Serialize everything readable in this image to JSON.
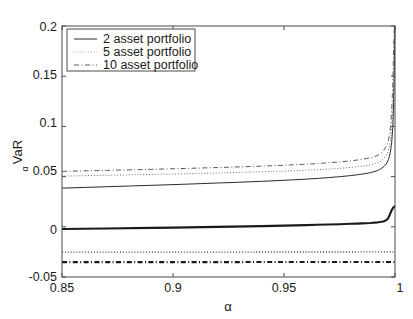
{
  "chart_data": {
    "type": "line",
    "title": "",
    "xlabel": "α",
    "ylabel": "VaR",
    "ylabel_sub": "α",
    "xlim": [
      0.85,
      1.0
    ],
    "ylim": [
      -0.05,
      0.2
    ],
    "grid": false,
    "xticks": [
      0.85,
      0.9,
      0.95,
      1.0
    ],
    "xtick_labels": [
      "0.85",
      "0.9",
      "0.95",
      "1"
    ],
    "yticks": [
      -0.05,
      0,
      0.05,
      0.1,
      0.15,
      0.2
    ],
    "ytick_labels": [
      "-0.05",
      "0",
      "0.05",
      "0.1",
      "0.15",
      "0.2"
    ],
    "legend": {
      "position": "upper-left",
      "entries": [
        {
          "label": "2 asset portfolio",
          "style": "solid"
        },
        {
          "label": "5 asset portfolio",
          "style": "dotted"
        },
        {
          "label": "10 asset portfolio",
          "style": "dash-dot"
        }
      ]
    },
    "series": [
      {
        "name": "2 asset portfolio upper",
        "style": "solid",
        "width": 1.0,
        "color": "#2b2b2b",
        "x": [
          0.85,
          0.86,
          0.87,
          0.88,
          0.89,
          0.9,
          0.91,
          0.92,
          0.93,
          0.94,
          0.95,
          0.955,
          0.96,
          0.965,
          0.97,
          0.975,
          0.98,
          0.983,
          0.985,
          0.987,
          0.989,
          0.99,
          0.991,
          0.992,
          0.993,
          0.994,
          0.995,
          0.996,
          0.9965,
          0.997,
          0.9975,
          0.998,
          0.9985,
          0.999,
          0.9993,
          0.9996,
          0.9998,
          1.0
        ],
        "y": [
          0.0385,
          0.0392,
          0.0399,
          0.0406,
          0.0413,
          0.042,
          0.0428,
          0.0436,
          0.0444,
          0.0453,
          0.0463,
          0.0469,
          0.0475,
          0.0482,
          0.049,
          0.0499,
          0.051,
          0.0518,
          0.0524,
          0.0531,
          0.054,
          0.0546,
          0.0552,
          0.056,
          0.057,
          0.0583,
          0.06,
          0.0625,
          0.0643,
          0.0668,
          0.0703,
          0.0755,
          0.084,
          0.099,
          0.116,
          0.148,
          0.18,
          0.2
        ]
      },
      {
        "name": "5 asset portfolio upper",
        "style": "dotted",
        "width": 1.0,
        "color": "#6e6e6e",
        "x": [
          0.85,
          0.86,
          0.87,
          0.88,
          0.89,
          0.9,
          0.91,
          0.92,
          0.93,
          0.94,
          0.95,
          0.955,
          0.96,
          0.965,
          0.97,
          0.975,
          0.98,
          0.983,
          0.985,
          0.987,
          0.989,
          0.99,
          0.991,
          0.992,
          0.993,
          0.994,
          0.995,
          0.996,
          0.9965,
          0.997,
          0.9975,
          0.998,
          0.9985,
          0.999,
          0.9993,
          0.9996,
          0.9998,
          1.0
        ],
        "y": [
          0.0505,
          0.0509,
          0.0513,
          0.0517,
          0.0521,
          0.0526,
          0.0531,
          0.0536,
          0.0542,
          0.0548,
          0.0555,
          0.0559,
          0.0564,
          0.0569,
          0.0575,
          0.0582,
          0.0591,
          0.0598,
          0.0603,
          0.0609,
          0.0617,
          0.0622,
          0.0628,
          0.0636,
          0.0646,
          0.066,
          0.068,
          0.071,
          0.0732,
          0.0762,
          0.0806,
          0.0872,
          0.098,
          0.117,
          0.138,
          0.172,
          0.193,
          0.2
        ]
      },
      {
        "name": "10 asset portfolio upper",
        "style": "dash-dot",
        "width": 1.0,
        "color": "#5a5a5a",
        "x": [
          0.85,
          0.86,
          0.87,
          0.88,
          0.89,
          0.9,
          0.91,
          0.92,
          0.93,
          0.94,
          0.95,
          0.955,
          0.96,
          0.965,
          0.97,
          0.975,
          0.98,
          0.983,
          0.985,
          0.987,
          0.989,
          0.99,
          0.991,
          0.992,
          0.993,
          0.994,
          0.995,
          0.996,
          0.9965,
          0.997,
          0.9975,
          0.998,
          0.9985,
          0.999,
          0.9993,
          0.9996,
          1.0
        ],
        "y": [
          0.0552,
          0.0557,
          0.0562,
          0.0567,
          0.0572,
          0.0578,
          0.0584,
          0.059,
          0.0597,
          0.0604,
          0.0613,
          0.0618,
          0.0624,
          0.063,
          0.0638,
          0.0646,
          0.0657,
          0.0665,
          0.0671,
          0.0679,
          0.0688,
          0.0694,
          0.0701,
          0.071,
          0.0722,
          0.0738,
          0.0762,
          0.0798,
          0.0824,
          0.086,
          0.0915,
          0.1,
          0.115,
          0.142,
          0.17,
          0.195,
          0.2
        ]
      },
      {
        "name": "2 asset portfolio lower",
        "style": "solid",
        "width": 2.1,
        "color": "#1a1a1a",
        "x": [
          0.85,
          0.87,
          0.89,
          0.9,
          0.92,
          0.94,
          0.95,
          0.96,
          0.965,
          0.97,
          0.975,
          0.98,
          0.983,
          0.985,
          0.987,
          0.989,
          0.99,
          0.991,
          0.992,
          0.993,
          0.994,
          0.995,
          0.9955,
          0.996,
          0.9965,
          0.997,
          0.9975,
          0.998,
          0.9985,
          0.999,
          0.9995,
          1.0
        ],
        "y": [
          -0.0022,
          -0.0017,
          -0.0011,
          -0.0008,
          -0.0001,
          0.0007,
          0.0012,
          0.0017,
          0.002,
          0.0023,
          0.0026,
          0.003,
          0.0032,
          0.0034,
          0.0036,
          0.0038,
          0.004,
          0.0042,
          0.0044,
          0.0047,
          0.0051,
          0.0056,
          0.006,
          0.0066,
          0.0075,
          0.009,
          0.0112,
          0.014,
          0.0165,
          0.0185,
          0.0198,
          0.0205
        ]
      },
      {
        "name": "5 asset portfolio lower",
        "style": "dotted",
        "width": 1.3,
        "color": "#3a3a3a",
        "x": [
          0.85,
          0.9,
          0.95,
          0.98,
          0.99,
          0.995,
          1.0
        ],
        "y": [
          -0.0252,
          -0.0252,
          -0.0251,
          -0.0251,
          -0.025,
          -0.025,
          -0.025
        ]
      },
      {
        "name": "10 asset portfolio lower",
        "style": "dash-dot",
        "width": 2.1,
        "color": "#1a1a1a",
        "x": [
          0.85,
          0.9,
          0.95,
          0.98,
          0.99,
          0.995,
          1.0
        ],
        "y": [
          -0.0352,
          -0.0352,
          -0.0351,
          -0.035,
          -0.035,
          -0.035,
          -0.035
        ]
      }
    ]
  },
  "axes": {
    "ylabel_text": "VaR",
    "ylabel_subscript": "α",
    "xlabel_text": "α"
  },
  "legend": {
    "entry_0": "2 asset portfolio",
    "entry_1": "5 asset portfolio",
    "entry_2": "10 asset portfolio"
  },
  "yticks": {
    "t0": "0.2",
    "t1": "0.15",
    "t2": "0.1",
    "t3": "0.05",
    "t4": "0",
    "t5": "-0.05"
  },
  "xticks": {
    "t0": "0.85",
    "t1": "0.9",
    "t2": "0.95",
    "t3": "1"
  }
}
